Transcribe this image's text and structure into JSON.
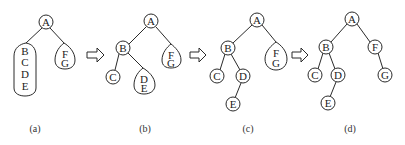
{
  "figure": {
    "panels": [
      {
        "caption": "(a)",
        "nodes": [
          {
            "id": "A",
            "label": "A"
          }
        ],
        "groups": [
          {
            "id": "BCDE",
            "labels": [
              "B",
              "C",
              "D",
              "E"
            ]
          },
          {
            "id": "FG",
            "labels": [
              "F",
              "G"
            ]
          }
        ]
      },
      {
        "caption": "(b)",
        "nodes": [
          {
            "id": "A",
            "label": "A"
          },
          {
            "id": "B",
            "label": "B"
          },
          {
            "id": "C",
            "label": "C"
          }
        ],
        "groups": [
          {
            "id": "DE",
            "labels": [
              "D",
              "E"
            ]
          },
          {
            "id": "FG",
            "labels": [
              "F",
              "G"
            ]
          }
        ]
      },
      {
        "caption": "(c)",
        "nodes": [
          {
            "id": "A",
            "label": "A"
          },
          {
            "id": "B",
            "label": "B"
          },
          {
            "id": "C",
            "label": "C"
          },
          {
            "id": "D",
            "label": "D"
          },
          {
            "id": "E",
            "label": "E"
          }
        ],
        "groups": [
          {
            "id": "FG",
            "labels": [
              "F",
              "G"
            ]
          }
        ]
      },
      {
        "caption": "(d)",
        "nodes": [
          {
            "id": "A",
            "label": "A"
          },
          {
            "id": "B",
            "label": "B"
          },
          {
            "id": "C",
            "label": "C"
          },
          {
            "id": "D",
            "label": "D"
          },
          {
            "id": "E",
            "label": "E"
          },
          {
            "id": "F",
            "label": "F"
          },
          {
            "id": "G",
            "label": "G"
          }
        ],
        "groups": []
      }
    ],
    "transition_arrow": "⇨"
  }
}
